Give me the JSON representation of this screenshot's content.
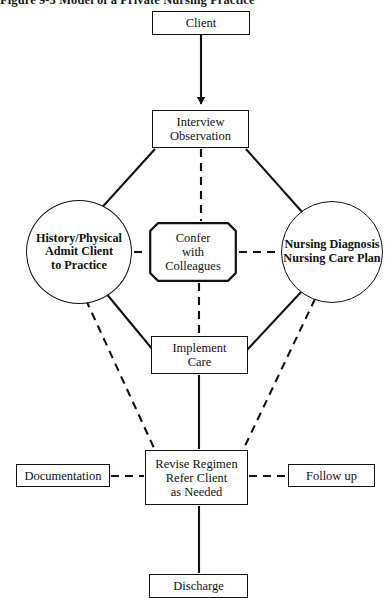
{
  "figure": {
    "number": "Figure 9-3",
    "title": "Model of a Private Nursing Practice",
    "full_title": "Figure 9-3  Model of a Private Nursing Practice",
    "type": "flowchart"
  },
  "nodes": {
    "client": {
      "label": "Client",
      "shape": "rectangle"
    },
    "interview": {
      "label": "Interview\nObservation",
      "shape": "rectangle"
    },
    "history": {
      "label": "History/Physical\nAdmit Client\nto Practice",
      "shape": "circle"
    },
    "confer": {
      "label": "Confer\nwith\nColleagues",
      "shape": "beveled-rectangle"
    },
    "diagnosis": {
      "label": "Nursing Diagnosis\nNursing Care Plan",
      "shape": "circle"
    },
    "implement": {
      "label": "Implement\nCare",
      "shape": "rectangle"
    },
    "revise": {
      "label": "Revise Regimen\nRefer Client\nas Needed",
      "shape": "rectangle"
    },
    "documentation": {
      "label": "Documentation",
      "shape": "rectangle"
    },
    "followup": {
      "label": "Follow up",
      "shape": "rectangle"
    },
    "discharge": {
      "label": "Discharge",
      "shape": "rectangle"
    }
  },
  "edges": [
    {
      "from": "client",
      "to": "interview",
      "style": "solid",
      "arrow": "down"
    },
    {
      "from": "interview",
      "to": "history",
      "style": "solid",
      "arrow": "none"
    },
    {
      "from": "interview",
      "to": "diagnosis",
      "style": "solid",
      "arrow": "none"
    },
    {
      "from": "interview",
      "to": "confer",
      "style": "dashed",
      "arrow": "none"
    },
    {
      "from": "history",
      "to": "confer",
      "style": "dashed",
      "arrow": "none"
    },
    {
      "from": "confer",
      "to": "diagnosis",
      "style": "dashed",
      "arrow": "none"
    },
    {
      "from": "history",
      "to": "implement",
      "style": "solid",
      "arrow": "none"
    },
    {
      "from": "diagnosis",
      "to": "implement",
      "style": "solid",
      "arrow": "none"
    },
    {
      "from": "confer",
      "to": "implement",
      "style": "dashed",
      "arrow": "none"
    },
    {
      "from": "history",
      "to": "revise",
      "style": "dashed",
      "arrow": "none"
    },
    {
      "from": "diagnosis",
      "to": "revise",
      "style": "dashed",
      "arrow": "none"
    },
    {
      "from": "implement",
      "to": "revise",
      "style": "solid",
      "arrow": "none"
    },
    {
      "from": "documentation",
      "to": "revise",
      "style": "dashed",
      "arrow": "none"
    },
    {
      "from": "revise",
      "to": "followup",
      "style": "dashed",
      "arrow": "none"
    },
    {
      "from": "revise",
      "to": "discharge",
      "style": "solid",
      "arrow": "none"
    }
  ],
  "colors": {
    "line": "#111111",
    "text": "#111111",
    "background": "#ffffff"
  }
}
